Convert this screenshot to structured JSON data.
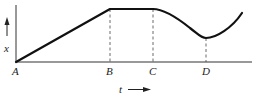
{
  "diagram": {
    "y_axis_label": "x",
    "x_axis_label": "t",
    "points": [
      {
        "label": "A",
        "x": 16
      },
      {
        "label": "B",
        "x": 110
      },
      {
        "label": "C",
        "x": 153
      },
      {
        "label": "D",
        "x": 206
      }
    ],
    "colors": {
      "curve": "#111111",
      "axis": "#333333",
      "dashed": "#444444"
    }
  }
}
